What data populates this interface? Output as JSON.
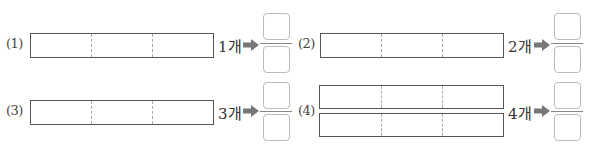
{
  "problems": [
    {
      "number": "(1)",
      "count": "1개",
      "rows": 1,
      "parts": 3
    },
    {
      "number": "(2)",
      "count": "2개",
      "rows": 1,
      "parts": 3
    },
    {
      "number": "(3)",
      "count": "3개",
      "rows": 1,
      "parts": 3
    },
    {
      "number": "(4)",
      "count": "4개",
      "rows": 2,
      "parts": 3
    }
  ],
  "fraction_answer": {
    "numerator": "",
    "denominator": ""
  },
  "icons": {
    "arrow": "right-arrow-icon"
  },
  "colors": {
    "arrow": "#777777",
    "box_border": "#bbbbbb",
    "bar_border": "#555555",
    "divider": "#aaaaaa"
  }
}
